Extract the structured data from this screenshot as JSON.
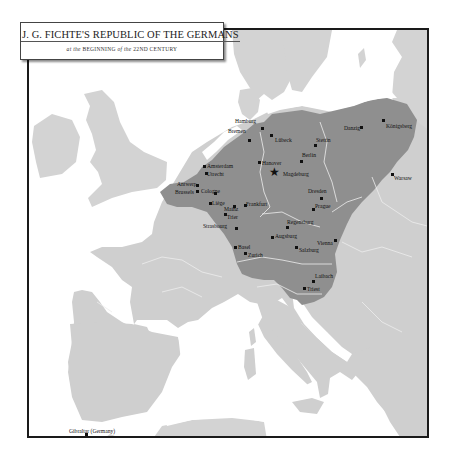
{
  "title": {
    "main": "J. G. FICHTE'S REPUBLIC OF THE GERMANS",
    "sub_prefix": "at the",
    "sub_beginning": "BEGINNING",
    "sub_of": "of the",
    "sub_century": "22ND CENTURY"
  },
  "colors": {
    "sea": "#ffffff",
    "land": "#cfcfcf",
    "german_territory": "#8f8f8f",
    "border_lines": "#e8e8e8",
    "frame": "#1a1a1a"
  },
  "capital": {
    "name": "Magdeburg",
    "icon": "star-icon"
  },
  "cities": [
    {
      "name": "Hamburg"
    },
    {
      "name": "Lübeck"
    },
    {
      "name": "Bremen"
    },
    {
      "name": "Stettin"
    },
    {
      "name": "Danzig"
    },
    {
      "name": "Königsberg"
    },
    {
      "name": "Hanover"
    },
    {
      "name": "Berlin"
    },
    {
      "name": "Amsterdam"
    },
    {
      "name": "Utrecht"
    },
    {
      "name": "Magdeburg"
    },
    {
      "name": "Warsaw"
    },
    {
      "name": "Antwerp"
    },
    {
      "name": "Brussels"
    },
    {
      "name": "Cologne"
    },
    {
      "name": "Dresden"
    },
    {
      "name": "Liège"
    },
    {
      "name": "Mainz"
    },
    {
      "name": "Frankfurt"
    },
    {
      "name": "Prague"
    },
    {
      "name": "Trier"
    },
    {
      "name": "Strasbourg"
    },
    {
      "name": "Regensburg"
    },
    {
      "name": "Augsburg"
    },
    {
      "name": "Vienna"
    },
    {
      "name": "Basel"
    },
    {
      "name": "Zurich"
    },
    {
      "name": "Salzburg"
    },
    {
      "name": "Laibach"
    },
    {
      "name": "Triest"
    },
    {
      "name": "Gibraltar (Germany)"
    }
  ]
}
